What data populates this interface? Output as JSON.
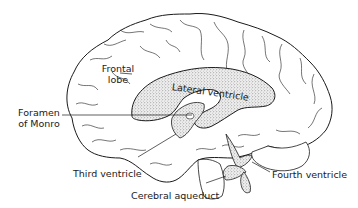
{
  "diagram": {
    "colors": {
      "outline": "#1a1a1a",
      "background": "#ffffff",
      "ventricle_fill": "#d6d6d6"
    },
    "labels": {
      "frontal_lobe_line1": "Frontal",
      "frontal_lobe_line2": "lobe",
      "lateral_ventricle": "Lateral ventricle",
      "foramen_line1": "Foramen",
      "foramen_line2": "of Monro",
      "third_ventricle": "Third ventricle",
      "cerebral_aqueduct": "Cerebral aqueduct",
      "fourth_ventricle": "Fourth ventricle"
    }
  }
}
